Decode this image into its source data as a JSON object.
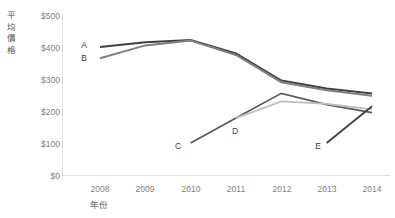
{
  "chart_data": {
    "type": "line",
    "title": "",
    "xlabel": "年份",
    "ylabel": "平均價格",
    "ylabel_chars": [
      "平",
      "均",
      "價",
      "格"
    ],
    "categories": [
      "2008",
      "2009",
      "2010",
      "2011",
      "2012",
      "2013",
      "2014"
    ],
    "x": [
      2008,
      2009,
      2010,
      2011,
      2012,
      2013,
      2014
    ],
    "ylim": [
      0,
      500
    ],
    "yticks": [
      0,
      100,
      200,
      300,
      400,
      500
    ],
    "ytick_labels": [
      "$0",
      "$100",
      "$200",
      "$300",
      "$400",
      "$500"
    ],
    "grid": false,
    "legend": "inline-labels",
    "series": [
      {
        "name": "A",
        "color": "#404040",
        "width": 2.0,
        "x": [
          2008,
          2009,
          2010,
          2011,
          2012,
          2013,
          2014
        ],
        "values": [
          400,
          415,
          422,
          380,
          295,
          270,
          255
        ]
      },
      {
        "name": "B",
        "color": "#808080",
        "width": 2.0,
        "x": [
          2008,
          2009,
          2010,
          2011,
          2012,
          2013,
          2014
        ],
        "values": [
          365,
          405,
          420,
          375,
          290,
          265,
          248
        ]
      },
      {
        "name": "C",
        "color": "#595959",
        "width": 1.6,
        "x": [
          2010,
          2011,
          2012,
          2013,
          2014
        ],
        "values": [
          100,
          178,
          255,
          220,
          195
        ]
      },
      {
        "name": "D",
        "color": "#bfbfbf",
        "width": 1.8,
        "x": [
          2011,
          2012,
          2013,
          2014
        ],
        "values": [
          178,
          230,
          222,
          205
        ]
      },
      {
        "name": "E",
        "color": "#404040",
        "width": 1.8,
        "x": [
          2013,
          2014
        ],
        "values": [
          100,
          215
        ]
      }
    ],
    "series_labels": [
      {
        "name": "A",
        "x_px": 84,
        "y_px": 45
      },
      {
        "name": "B",
        "x_px": 84,
        "y_px": 58
      },
      {
        "name": "C",
        "x_px": 178,
        "y_px": 146
      },
      {
        "name": "D",
        "x_px": 235,
        "y_px": 131
      },
      {
        "name": "E",
        "x_px": 318,
        "y_px": 146
      }
    ],
    "axis_colors": {
      "axis_line": "#d9d9d9",
      "tick_text": "#7f7f7f",
      "title_text": "#595959"
    }
  }
}
